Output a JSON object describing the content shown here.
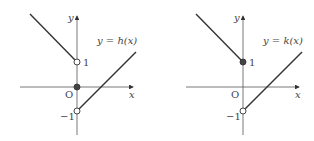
{
  "graphs": [
    {
      "name": "h",
      "equation": "y = h(x)",
      "y_axis_label": "y",
      "x_axis_label": "x",
      "origin_label": "O",
      "tick_pos": "1",
      "tick_neg": "−1",
      "points": {
        "at_1": "open",
        "at_0": "filled",
        "at_neg1": "open"
      }
    },
    {
      "name": "k",
      "equation": "y = k(x)",
      "y_axis_label": "y",
      "x_axis_label": "x",
      "origin_label": "O",
      "tick_pos": "1",
      "tick_neg": "−1",
      "points": {
        "at_1": "filled",
        "at_neg1": "open"
      }
    }
  ],
  "colors": {
    "line": "#333333",
    "axis": "#555555",
    "dot": "#444444"
  }
}
